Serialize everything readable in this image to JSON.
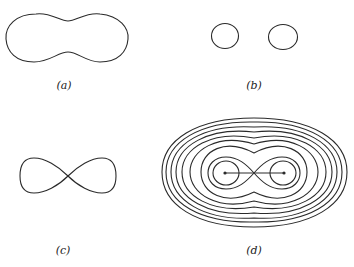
{
  "figure": {
    "panels": [
      {
        "id": "a",
        "label": "(a)",
        "description": "single peanut-shaped closed curve"
      },
      {
        "id": "b",
        "label": "(b)",
        "description": "two separate small closed ovals"
      },
      {
        "id": "c",
        "label": "(c)",
        "description": "figure-eight lemniscate curve"
      },
      {
        "id": "d",
        "label": "(d)",
        "description": "nested family of level curves around two foci joined by a segment"
      }
    ],
    "panel_d": {
      "outer_contour_count": 6,
      "foci": 2,
      "has_connecting_segment": true
    }
  },
  "colors": {
    "stroke": "#2a2a2a",
    "background": "#ffffff"
  }
}
